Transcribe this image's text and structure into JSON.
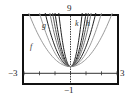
{
  "chart_data": {
    "type": "line",
    "title": "",
    "xlabel": "",
    "ylabel": "",
    "xlim": [
      -3,
      3
    ],
    "ylim": [
      -1,
      9
    ],
    "tick_labels": {
      "xmin": "−3",
      "xmax": "3",
      "ymin": "−1",
      "ymax": "9"
    },
    "grid": false,
    "x_ticks": [
      -3,
      -2,
      -1,
      0,
      1,
      2,
      3
    ],
    "series": [
      {
        "name": "f",
        "formula": "y = a x^2 + 1",
        "a": 1.1,
        "color": "#9a9a9a"
      },
      {
        "name": "g",
        "formula": "y = a x^2 + 1",
        "a": 3,
        "color": "#222222"
      },
      {
        "name": "",
        "a": 4.5,
        "color": "#777777"
      },
      {
        "name": "",
        "a": 8,
        "color": "#222222"
      },
      {
        "name": "k",
        "formula": "y = a x^2 + 1",
        "a": 14,
        "color": "#222222"
      },
      {
        "name": "h",
        "formula": "y = a x^2 + 1",
        "a": 6,
        "color": "#555555"
      },
      {
        "name": "",
        "a": 2,
        "color": "#9a9a9a"
      }
    ],
    "vertex": [
      0,
      1
    ]
  },
  "labels": {
    "ymax": "9",
    "ymin": "−1",
    "xmin": "−3",
    "xmax": "3",
    "f": "f",
    "g": "g",
    "k": "k",
    "h": "h"
  }
}
